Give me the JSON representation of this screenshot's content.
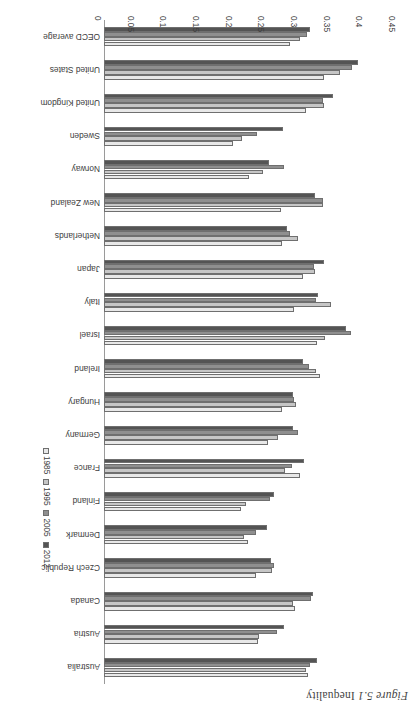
{
  "figure": {
    "caption_number": "Figure 5.1",
    "caption_text": "Inequality"
  },
  "legend": {
    "position": "right",
    "items": [
      {
        "label": "1985",
        "color": "#e8e8e8"
      },
      {
        "label": "1995",
        "color": "#c6c6c6"
      },
      {
        "label": "2005",
        "color": "#8f8f8f"
      },
      {
        "label": "2012",
        "color": "#545454"
      }
    ]
  },
  "axis": {
    "ticks": [
      "0",
      "0.05",
      "0.1",
      "0.15",
      "0.2",
      "0.25",
      "0.3",
      "0.35",
      "0.4",
      "0.45"
    ],
    "min": 0,
    "max": 0.45
  },
  "chart_data": {
    "type": "bar",
    "orientation": "horizontal",
    "title": "Inequality",
    "xlabel": "",
    "ylabel": "",
    "xlim": [
      0,
      0.45
    ],
    "grid": false,
    "legend_position": "right",
    "categories": [
      "Australia",
      "Austria",
      "Canada",
      "Czech Republic",
      "Denmark",
      "Finland",
      "France",
      "Germany",
      "Hungary",
      "Ireland",
      "Israel",
      "Italy",
      "Japan",
      "Netherlands",
      "New Zealand",
      "Norway",
      "Sweden",
      "United Kingdom",
      "United States",
      "OECD average"
    ],
    "series": [
      {
        "name": "1985",
        "color": "#e8e8e8",
        "values": [
          0.312,
          0.236,
          0.293,
          0.232,
          0.221,
          0.209,
          0.3,
          0.251,
          0.273,
          0.331,
          0.326,
          0.291,
          0.304,
          0.272,
          0.271,
          0.222,
          0.198,
          0.309,
          0.337,
          0.285
        ]
      },
      {
        "name": "1995",
        "color": "#c6c6c6",
        "values": [
          0.309,
          0.238,
          0.289,
          0.257,
          0.215,
          0.218,
          0.277,
          0.266,
          0.294,
          0.324,
          0.338,
          0.348,
          0.323,
          0.297,
          0.335,
          0.243,
          0.211,
          0.337,
          0.361,
          0.3
        ]
      },
      {
        "name": "2005",
        "color": "#8f8f8f",
        "values": [
          0.315,
          0.265,
          0.317,
          0.26,
          0.232,
          0.254,
          0.288,
          0.297,
          0.291,
          0.314,
          0.378,
          0.325,
          0.321,
          0.284,
          0.335,
          0.276,
          0.234,
          0.335,
          0.38,
          0.311
        ]
      },
      {
        "name": "2012",
        "color": "#545454",
        "values": [
          0.326,
          0.276,
          0.32,
          0.256,
          0.249,
          0.26,
          0.306,
          0.289,
          0.29,
          0.304,
          0.371,
          0.327,
          0.336,
          0.28,
          0.323,
          0.253,
          0.274,
          0.351,
          0.389,
          0.315
        ]
      }
    ]
  }
}
